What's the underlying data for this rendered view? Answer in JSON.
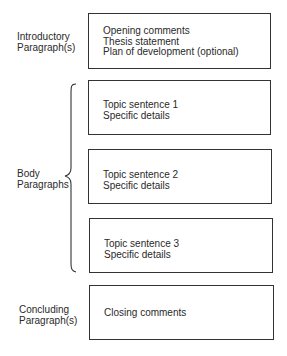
{
  "diagram": {
    "sections": [
      {
        "label_lines": [
          "Introductory",
          "Paragraph(s)"
        ],
        "boxes": [
          [
            "Opening comments",
            "Thesis statement",
            "Plan of development (optional)"
          ]
        ]
      },
      {
        "label_lines": [
          "Body",
          "Paragraphs"
        ],
        "boxes": [
          [
            "Topic sentence 1",
            "Specific details"
          ],
          [
            "Topic sentence 2",
            "Specific details"
          ],
          [
            "Topic sentence 3",
            "Specific details"
          ]
        ]
      },
      {
        "label_lines": [
          "Concluding",
          "Paragraph(s)"
        ],
        "boxes": [
          [
            "Closing comments"
          ]
        ]
      }
    ]
  }
}
